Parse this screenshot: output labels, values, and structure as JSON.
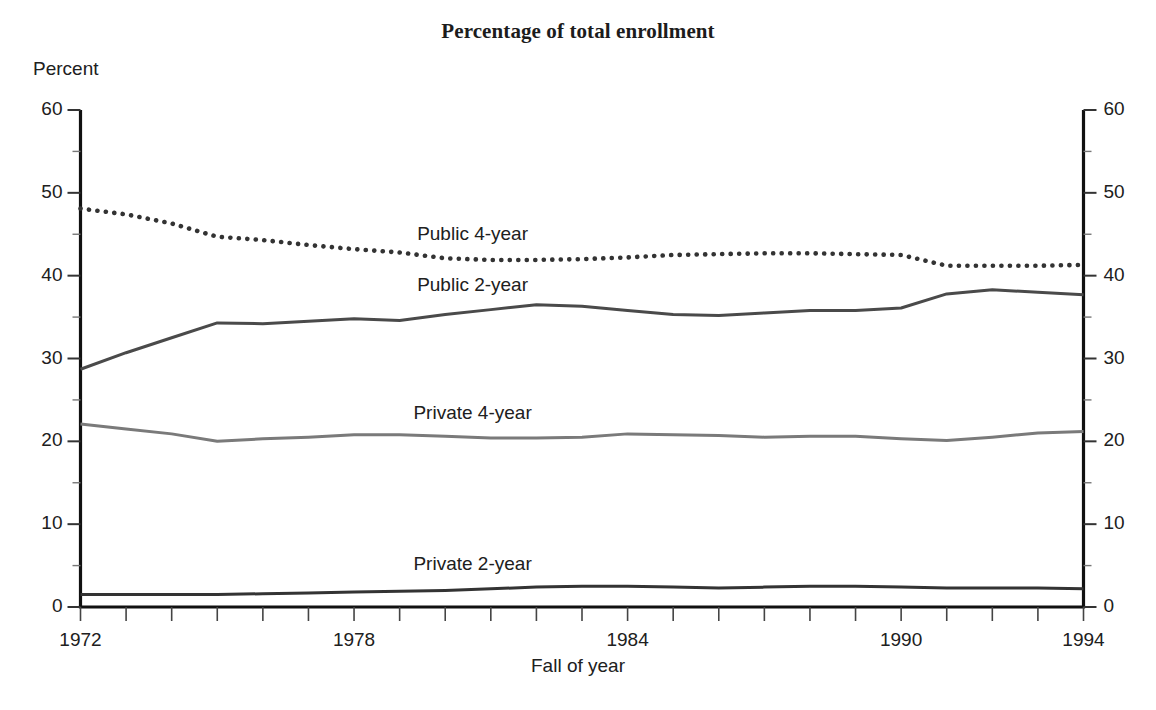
{
  "chart_data": {
    "type": "line",
    "title": "Percentage of total enrollment",
    "xlabel": "Fall of year",
    "ylabel": "Percent",
    "xlim": [
      1972,
      1994
    ],
    "ylim": [
      0,
      60
    ],
    "grid": false,
    "legend_position": "inline-labels",
    "x_tick_labels": [
      "1972",
      "1978",
      "1984",
      "1990",
      "1994"
    ],
    "x_tick_values": [
      1972,
      1978,
      1984,
      1990,
      1994
    ],
    "x_minor_tick_step": 1,
    "y_tick_labels_left": [
      "0",
      "10",
      "20",
      "30",
      "40",
      "50",
      "60"
    ],
    "y_tick_labels_right": [
      "0",
      "10",
      "20",
      "30",
      "40",
      "50",
      "60"
    ],
    "y_tick_values": [
      0,
      10,
      20,
      30,
      40,
      50,
      60
    ],
    "y_minor_tick_step": 5,
    "x": [
      1972,
      1973,
      1974,
      1975,
      1976,
      1977,
      1978,
      1979,
      1980,
      1981,
      1982,
      1983,
      1984,
      1985,
      1986,
      1987,
      1988,
      1989,
      1990,
      1991,
      1992,
      1993,
      1994
    ],
    "series": [
      {
        "name": "Public 4-year",
        "style": "dotted",
        "color": "#333333",
        "label_x": 1980.6,
        "label_y": 44.8,
        "values": [
          48.1,
          47.4,
          46.3,
          44.7,
          44.3,
          43.7,
          43.2,
          42.8,
          42.1,
          41.9,
          41.9,
          42.0,
          42.2,
          42.5,
          42.6,
          42.7,
          42.7,
          42.6,
          42.5,
          41.2,
          41.2,
          41.2,
          41.3
        ]
      },
      {
        "name": "Public 2-year",
        "style": "solid",
        "color": "#4a4a4a",
        "label_x": 1980.6,
        "label_y": 38.6,
        "values": [
          28.7,
          30.7,
          32.5,
          34.3,
          34.2,
          34.5,
          34.8,
          34.6,
          35.3,
          35.9,
          36.5,
          36.3,
          35.8,
          35.3,
          35.2,
          35.5,
          35.8,
          35.8,
          36.1,
          37.8,
          38.3,
          38.0,
          37.7
        ]
      },
      {
        "name": "Private 4-year",
        "style": "solid",
        "color": "#7a7a7a",
        "label_x": 1980.6,
        "label_y": 23.2,
        "values": [
          22.1,
          21.5,
          20.9,
          20.0,
          20.3,
          20.5,
          20.8,
          20.8,
          20.6,
          20.4,
          20.4,
          20.5,
          20.9,
          20.8,
          20.7,
          20.5,
          20.6,
          20.6,
          20.3,
          20.1,
          20.5,
          21.0,
          21.2
        ]
      },
      {
        "name": "Private 2-year",
        "style": "solid",
        "color": "#333333",
        "label_x": 1980.6,
        "label_y": 5.0,
        "values": [
          1.5,
          1.5,
          1.5,
          1.5,
          1.6,
          1.7,
          1.8,
          1.9,
          2.0,
          2.2,
          2.4,
          2.5,
          2.5,
          2.4,
          2.3,
          2.4,
          2.5,
          2.5,
          2.4,
          2.3,
          2.3,
          2.3,
          2.2
        ]
      }
    ]
  }
}
